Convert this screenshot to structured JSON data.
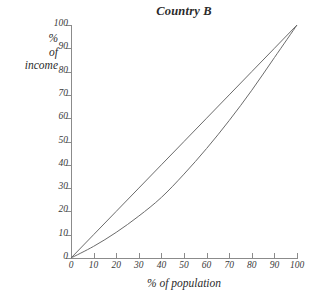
{
  "chart_data": {
    "type": "line",
    "title": "Country B",
    "xlabel": "% of population",
    "ylabel_lines": [
      "%",
      "of",
      "income"
    ],
    "ylabel": "% of income",
    "xlim": [
      0,
      100
    ],
    "ylim": [
      0,
      100
    ],
    "xticks": [
      0,
      10,
      20,
      30,
      40,
      50,
      60,
      70,
      80,
      90,
      100
    ],
    "yticks": [
      0,
      10,
      20,
      30,
      40,
      50,
      60,
      70,
      80,
      90,
      100
    ],
    "grid": false,
    "legend": null,
    "line_color": "#6b6b6b",
    "axis_color": "#8b8b8b",
    "background": "#ffffff",
    "series": [
      {
        "name": "line of equality",
        "x": [
          0,
          10,
          20,
          30,
          40,
          50,
          60,
          70,
          80,
          90,
          100
        ],
        "values": [
          0,
          10,
          20,
          30,
          40,
          50,
          60,
          70,
          80,
          90,
          100
        ]
      },
      {
        "name": "Lorenz curve",
        "x": [
          0,
          10,
          20,
          30,
          40,
          50,
          60,
          70,
          80,
          90,
          100
        ],
        "values": [
          0,
          5,
          11,
          18,
          26,
          36,
          47,
          59,
          72,
          86,
          100
        ]
      }
    ]
  }
}
